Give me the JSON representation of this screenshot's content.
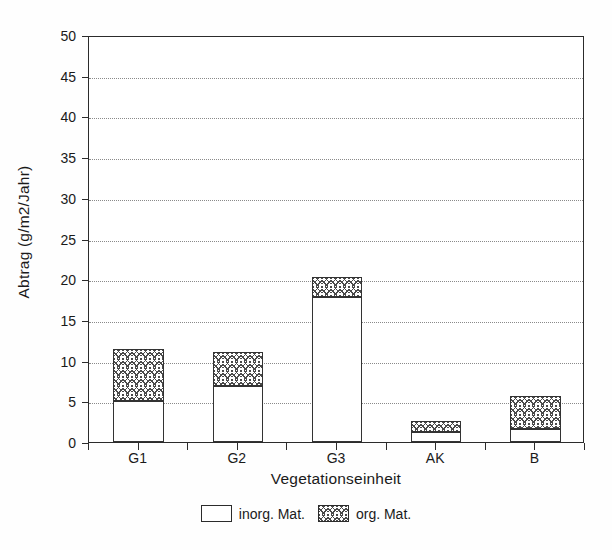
{
  "chart_data": {
    "type": "bar",
    "subtype": "stacked-vertical",
    "title": "",
    "xlabel": "Vegetationseinheit",
    "ylabel": "Abtrag (g/m2/Jahr)",
    "categories": [
      "G1",
      "G2",
      "G3",
      "AK",
      "B"
    ],
    "series": [
      {
        "name": "inorg. Mat.",
        "values": [
          5.0,
          6.9,
          17.8,
          1.2,
          1.6
        ]
      },
      {
        "name": "org. Mat.",
        "values": [
          6.4,
          4.2,
          2.5,
          1.4,
          4.0
        ]
      }
    ],
    "totals": [
      11.4,
      11.1,
      20.3,
      2.6,
      5.6
    ],
    "ylim": [
      0,
      50
    ],
    "ytick_values": [
      0,
      5,
      10,
      15,
      20,
      25,
      30,
      35,
      40,
      45,
      50
    ],
    "ytick_labels": [
      "0",
      "5",
      "10",
      "15",
      "20",
      "25",
      "30",
      "35",
      "40",
      "45",
      "50"
    ],
    "grid": "horizontal-dotted",
    "legend_position": "bottom-center",
    "legend": [
      {
        "label": "inorg. Mat.",
        "pattern": "empty",
        "fill": "#ffffff"
      },
      {
        "label": "org. Mat.",
        "pattern": "cross-hatch",
        "fill": "#ffffff"
      }
    ],
    "colors": {
      "axis": "#2b2b2b",
      "grid": "#8a8a8a",
      "bar_edge": "#333333",
      "hatch": "#4a4a4a",
      "background": "#ffffff"
    }
  }
}
